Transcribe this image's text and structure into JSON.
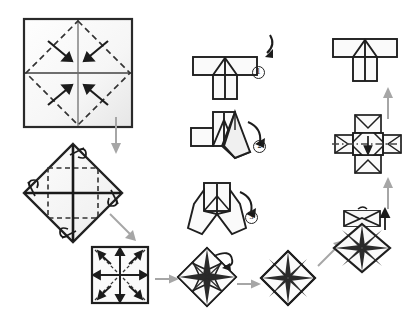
{
  "diagram": {
    "type": "origami-folding-instructions",
    "title": "",
    "background_color": "#ffffff",
    "line_color": "#1f1f1f",
    "fold_line_color": "#555555",
    "paper_fill": "#fdfdfd",
    "paper_shade": "#ececec",
    "arrow_color": "#9a9a9a",
    "action_arrow_color": "#1f1f1f"
  },
  "steps": [
    {
      "id": "step-1-square-creases",
      "label": "square with diagonal valley creases and four corner-in arrows",
      "shape": "square",
      "x": 22,
      "y": 17,
      "w": 112,
      "h": 112,
      "arrow_count": 4
    },
    {
      "id": "step-2-diamond-creases",
      "label": "rotated diamond with inner square crease and four small loop arrows",
      "shape": "diamond",
      "x": 20,
      "y": 140,
      "w": 104,
      "h": 104,
      "arrow_count": 4
    },
    {
      "id": "step-3-small-square-creases",
      "label": "small square divided in quarters with four diagonal arrows",
      "shape": "square",
      "x": 90,
      "y": 245,
      "w": 58,
      "h": 58,
      "arrow_count": 4
    },
    {
      "id": "step-4-pinwheel-star",
      "label": "eight-point star pinwheel with curling petal arrow",
      "shape": "star-diamond",
      "x": 176,
      "y": 246,
      "w": 62,
      "h": 62,
      "arrow_count": 1
    },
    {
      "id": "step-5-pinwheel-flat",
      "label": "flat eight-segment pinwheel diamond",
      "shape": "pinwheel-diamond",
      "x": 258,
      "y": 250,
      "w": 56,
      "h": 56,
      "arrow_count": 0
    },
    {
      "id": "step-6-hooded-pinwheel",
      "label": "pinwheel diamond with folded hood flap on top and up arrow",
      "shape": "hooded-diamond",
      "x": 330,
      "y": 208,
      "w": 62,
      "h": 66,
      "arrow_count": 1
    },
    {
      "id": "step-7-cross-model",
      "label": "cross shaped model with dash-dot axis and downward fold arrow",
      "shape": "cross",
      "x": 334,
      "y": 114,
      "w": 66,
      "h": 60,
      "arrow_count": 1
    },
    {
      "id": "step-8-t-shape-final",
      "label": "finished t-shaped module, top right",
      "shape": "t-shape",
      "x": 331,
      "y": 37,
      "w": 66,
      "h": 44,
      "arrow_count": 0
    },
    {
      "id": "step-9-t-shape-marked",
      "label": "t-shaped module with curved fold arrow marked 1",
      "shape": "t-shape",
      "x": 192,
      "y": 55,
      "w": 66,
      "h": 44,
      "arrow_count": 1,
      "marker": "1"
    },
    {
      "id": "step-10-side-flap",
      "label": "module with one wing swung down, curved arrow marked 2",
      "shape": "side-flap",
      "x": 189,
      "y": 110,
      "w": 72,
      "h": 56,
      "arrow_count": 1,
      "marker": "2"
    },
    {
      "id": "step-11-both-wings",
      "label": "module with both wings swung down, curved arrow marked 3",
      "shape": "both-wings",
      "x": 180,
      "y": 182,
      "w": 72,
      "h": 56,
      "arrow_count": 1,
      "marker": "3"
    }
  ],
  "markers": [
    {
      "id": "marker-1",
      "text": "1",
      "x": 253,
      "y": 71
    },
    {
      "id": "marker-2",
      "text": "2",
      "x": 255,
      "y": 143
    },
    {
      "id": "marker-3",
      "text": "3",
      "x": 246,
      "y": 213
    }
  ],
  "flow_arrows": [
    {
      "id": "flow-down-left",
      "label": "down arrow from step 1 to step 2",
      "direction": "down",
      "x": 113,
      "y": 118,
      "length": 34
    },
    {
      "id": "flow-diagonal-left",
      "label": "diagonal arrow from step 2 to step 3",
      "direction": "down-right",
      "x": 110,
      "y": 214,
      "length": 30
    },
    {
      "id": "flow-right-1",
      "label": "right arrow from step 3 to step 4",
      "direction": "right",
      "x": 154,
      "y": 278,
      "length": 22
    },
    {
      "id": "flow-right-2",
      "label": "right arrow from step 4 to step 5",
      "direction": "right",
      "x": 236,
      "y": 283,
      "length": 22
    },
    {
      "id": "flow-diagonal-right",
      "label": "diagonal arrow from step 5 to step 6",
      "direction": "up-right",
      "x": 318,
      "y": 250,
      "length": 26
    },
    {
      "id": "flow-up-1",
      "label": "up arrow from step 6 to step 7",
      "direction": "up",
      "x": 387,
      "y": 178,
      "length": 28
    },
    {
      "id": "flow-up-2",
      "label": "up arrow from step 7 to step 8",
      "direction": "up",
      "x": 387,
      "y": 88,
      "length": 28
    }
  ]
}
